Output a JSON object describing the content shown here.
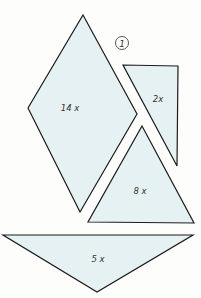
{
  "figure": {
    "marker": "1",
    "fill_color": "#e6f1f3",
    "stroke_color": "#1c1c1c",
    "background": "#fdfdfb"
  },
  "pieces": [
    {
      "id": "diamond",
      "shape": "rhombus",
      "label": "14 x",
      "points": "83,15 137,114 80,212 28,108"
    },
    {
      "id": "right-triangle",
      "shape": "right triangle",
      "label": "2x",
      "points": "123,65 178,66 177,166"
    },
    {
      "id": "middle-triangle",
      "shape": "triangle",
      "label": "8 x",
      "points": "142,126 194,223 88,222"
    },
    {
      "id": "bottom-triangle",
      "shape": "wide triangle",
      "label": "5 x",
      "points": "3,235 193,235 97,292"
    }
  ]
}
